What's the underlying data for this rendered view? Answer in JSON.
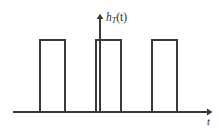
{
  "figure": {
    "name": "rectangular-pulse-train",
    "background_color": "#ffffff",
    "stroke_color": "#3a3a3a",
    "text_color": "#2b2b2b"
  },
  "labels": {
    "y_axis": "h",
    "y_axis_subscript": "T",
    "y_axis_argument": "(t)",
    "y_axis_full": "h_T(t)",
    "x_axis": "t"
  },
  "icons": {
    "y_arrow": "arrow-up-icon",
    "x_arrow": "arrow-right-icon"
  },
  "chart_data": {
    "type": "line",
    "title": "",
    "subtitle": "",
    "xlabel": "t",
    "ylabel": "h_T(t)",
    "xlim": [
      13,
      211
    ],
    "ylim": [
      112,
      40
    ],
    "grid": false,
    "legend": false,
    "legend_position": "none",
    "series": [
      {
        "name": "h_T(t)",
        "waveform": "rectangular pulse train",
        "baseline_y": 112,
        "amplitude_y": 40,
        "pulses": [
          {
            "x_start": 40,
            "x_end": 65,
            "top": 40,
            "bottom": 112
          },
          {
            "x_start": 96,
            "x_end": 121,
            "top": 40,
            "bottom": 112
          },
          {
            "x_start": 152,
            "x_end": 177,
            "top": 40,
            "bottom": 112
          }
        ],
        "pulse_width": 25,
        "pulse_period": 56,
        "pulse_count": 3
      }
    ],
    "axes": {
      "x_axis": {
        "y": 112,
        "x_start": 13,
        "x_end": 211,
        "arrow": "right"
      },
      "y_axis": {
        "x": 100,
        "y_start": 112,
        "y_end": 15,
        "arrow": "up"
      }
    },
    "annotations": [
      {
        "text": "h_T(t)",
        "x": 106,
        "y": 18,
        "role": "y-axis-label"
      },
      {
        "text": "t",
        "x": 209,
        "y": 122,
        "role": "x-axis-label"
      }
    ]
  }
}
